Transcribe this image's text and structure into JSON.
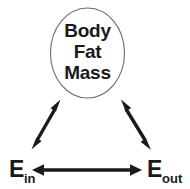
{
  "diagram": {
    "colors": {
      "background": "#ffffff",
      "oval_stroke": "#6b6b6b",
      "arrow": "#1a1a1a",
      "text": "#1a1a1a"
    },
    "oval_node": {
      "name": "body-fat-mass",
      "lines": [
        "Body",
        "Fat",
        "Mass"
      ]
    },
    "left_node": {
      "name": "energy-in",
      "main": "E",
      "subscript": "in"
    },
    "right_node": {
      "name": "energy-out",
      "main": "E",
      "subscript": "out"
    },
    "connectors": [
      {
        "name": "arrow-ein-to-body",
        "type": "double-headed",
        "from": "E_in",
        "to": "Body Fat Mass"
      },
      {
        "name": "arrow-eout-to-body",
        "type": "double-headed",
        "from": "E_out",
        "to": "Body Fat Mass"
      },
      {
        "name": "arrow-ein-to-eout",
        "type": "double-headed",
        "from": "E_in",
        "to": "E_out"
      }
    ]
  }
}
